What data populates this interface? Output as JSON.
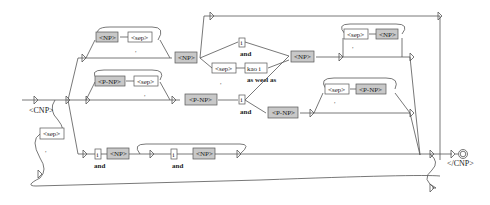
{
  "diagram": {
    "type": "grammar-graph",
    "initial_label": "<CNP>",
    "final_label": "</CNP>",
    "nodes": {
      "np_loop_np": "<NP>",
      "np_loop_sep": "<sep>",
      "np_loop_comma": ",",
      "np_main": "<NP>",
      "i_and": "i",
      "and_label_1": "and",
      "sep_kai": "<sep>",
      "sep_kai_comma": ",",
      "kai_i": "kao i",
      "as_well_as": "as weel as",
      "np_right": "<NP>",
      "right_loop_sep": "<sep>",
      "right_loop_np": "<NP>",
      "right_loop_comma": ",",
      "pnp_loop_pnp": "<P-NP>",
      "pnp_loop_sep": "<sep>",
      "pnp_loop_comma": ",",
      "pnp_main": "<P-NP>",
      "i_and_2": "i",
      "and_label_2": "and",
      "pnp_right": "<P-NP>",
      "right2_loop_sep": "<sep>",
      "right2_loop_pnp": "<P-NP>",
      "right2_loop_comma": ",",
      "left_sep": "<sep>",
      "left_sep_comma": ",",
      "bottom_i_1": "i",
      "bottom_and_1": "and",
      "bottom_np_1": "<NP>",
      "bottom_i_2": "i",
      "bottom_and_2": "and",
      "bottom_np_2": "<NP>"
    }
  }
}
